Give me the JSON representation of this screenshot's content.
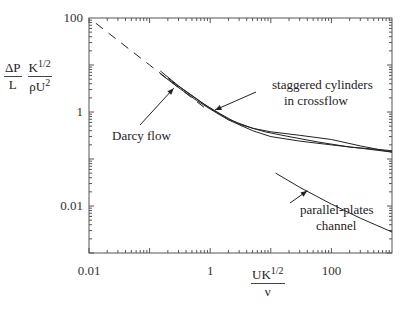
{
  "chart_data": {
    "type": "line",
    "title": "",
    "xscale": "log",
    "yscale": "log",
    "xlim": [
      0.01,
      1000
    ],
    "ylim": [
      0.001,
      100
    ],
    "x_ticks": [
      "0.01",
      "1",
      "100"
    ],
    "y_ticks": [
      "100",
      "1",
      "0.01"
    ],
    "xlabel": {
      "num": "UK",
      "sup": "1/2",
      "den": "ν"
    },
    "ylabel": {
      "f1_num": "ΔP",
      "f1_den": "L",
      "f2_num": "K",
      "f2_sup": "1/2",
      "f2_den": "ρU",
      "f2_den_sup": "2"
    },
    "grid": false,
    "series": [
      {
        "name": "Darcy flow",
        "style": "dashed",
        "x": [
          0.013,
          0.1,
          0.5,
          0.9
        ],
        "y": [
          77,
          10,
          2,
          1.11
        ]
      },
      {
        "name": "staggered cylinders in crossflow (a)",
        "style": "solid",
        "x": [
          0.15,
          0.3,
          0.6,
          1,
          2,
          5,
          10,
          30,
          100,
          300,
          1000
        ],
        "y": [
          7.5,
          3.6,
          1.9,
          1.2,
          0.7,
          0.45,
          0.38,
          0.32,
          0.26,
          0.19,
          0.14
        ]
      },
      {
        "name": "staggered cylinders in crossflow (b)",
        "style": "solid",
        "x": [
          0.15,
          0.3,
          0.6,
          1,
          2,
          5,
          10,
          30,
          100,
          300,
          1000
        ],
        "y": [
          6.5,
          3.3,
          1.75,
          1.15,
          0.68,
          0.4,
          0.3,
          0.24,
          0.2,
          0.17,
          0.14
        ]
      },
      {
        "name": "staggered cylinders in crossflow (c)",
        "style": "solid",
        "x": [
          0.2,
          0.4,
          0.8,
          1.5,
          3,
          8,
          20,
          60,
          200,
          1000
        ],
        "y": [
          5.2,
          2.7,
          1.45,
          0.9,
          0.55,
          0.38,
          0.3,
          0.23,
          0.18,
          0.15
        ]
      },
      {
        "name": "parallel-plates channel",
        "style": "solid",
        "x": [
          12,
          30,
          100,
          300,
          1000
        ],
        "y": [
          0.05,
          0.025,
          0.011,
          0.0055,
          0.0028
        ]
      }
    ],
    "annotations": [
      {
        "text": "Darcy flow",
        "arrow_to": [
          0.25,
          3.2
        ]
      },
      {
        "text": [
          "staggered cylinders",
          "in crossflow"
        ],
        "arrow_to": [
          1.2,
          1.1
        ]
      },
      {
        "text": [
          "parallel-plates",
          "channel"
        ],
        "arrow_to": [
          40,
          0.021
        ]
      }
    ]
  }
}
